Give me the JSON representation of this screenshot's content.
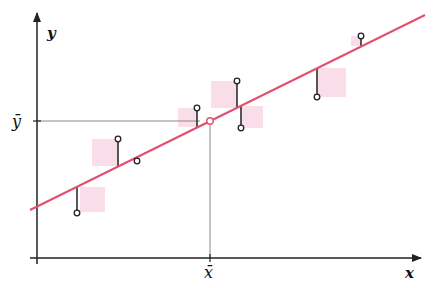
{
  "diagram": {
    "axes": {
      "x_label": "x",
      "y_label": "y",
      "x_mean_label": "x̄",
      "y_mean_label": "ȳ"
    },
    "colors": {
      "regression_line": "#e0506e",
      "residual_square": "#f9dde8",
      "axis": "#222222",
      "guide": "#888888",
      "point_stroke": "#222222",
      "mean_point": "#e0506e"
    },
    "regression_line": {
      "x1": 30,
      "y1": 210,
      "x2": 425,
      "y2": 15
    },
    "mean_point": {
      "x": 210,
      "y": 121
    },
    "points": [
      {
        "x": 77,
        "y": 213,
        "fit_y": 187
      },
      {
        "x": 118,
        "y": 139,
        "fit_y": 166
      },
      {
        "x": 137,
        "y": 161,
        "fit_y": 157
      },
      {
        "x": 197,
        "y": 108,
        "fit_y": 127
      },
      {
        "x": 237,
        "y": 81,
        "fit_y": 108
      },
      {
        "x": 241,
        "y": 128,
        "fit_y": 106
      },
      {
        "x": 317,
        "y": 97,
        "fit_y": 68
      },
      {
        "x": 361,
        "y": 36,
        "fit_y": 46
      }
    ],
    "squares": [
      {
        "x": 80,
        "y": 187,
        "w": 25,
        "h": 25
      },
      {
        "x": 92,
        "y": 139,
        "w": 26,
        "h": 27
      },
      {
        "x": 178,
        "y": 108,
        "w": 19,
        "h": 19
      },
      {
        "x": 211,
        "y": 81,
        "w": 26,
        "h": 27
      },
      {
        "x": 241,
        "y": 106,
        "w": 22,
        "h": 22
      },
      {
        "x": 317,
        "y": 68,
        "w": 29,
        "h": 29
      },
      {
        "x": 351,
        "y": 36,
        "w": 10,
        "h": 10
      }
    ]
  }
}
